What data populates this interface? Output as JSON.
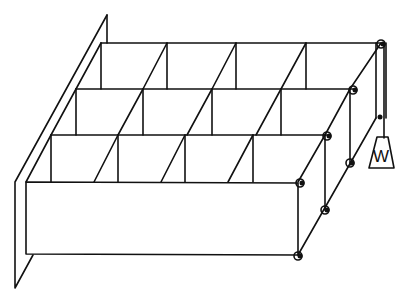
{
  "diagram": {
    "rows": 3,
    "columns": 4,
    "weight_label": "W",
    "colors": {
      "stroke": "#111111",
      "background": "#ffffff"
    }
  }
}
